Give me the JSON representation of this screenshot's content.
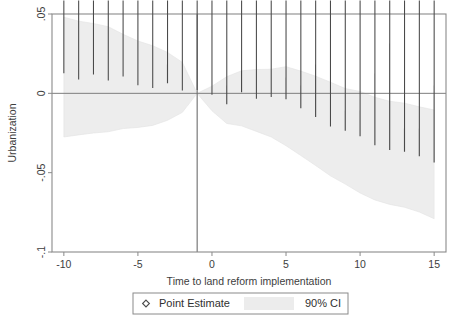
{
  "chart_data": {
    "type": "scatter",
    "title": "",
    "subtitle": "",
    "xlabel": "Time to land reform implementation",
    "ylabel": "Urbanization",
    "xlim": [
      -10.8,
      15.8
    ],
    "ylim": [
      -0.1,
      0.05
    ],
    "xticks": [
      -10,
      -5,
      0,
      5,
      10,
      15
    ],
    "xticklabels": [
      "-10",
      "-5",
      "0",
      "5",
      "10",
      "15"
    ],
    "yticks": [
      0.05,
      0,
      -0.05,
      -0.1
    ],
    "yticklabels": [
      ".05",
      "0",
      "-.05",
      "-.1"
    ],
    "grid": false,
    "legend_position": "below-plot",
    "reference_line_x": -1,
    "zero_line_y": 0,
    "x": [
      -10,
      -9,
      -8,
      -7,
      -6,
      -5,
      -4,
      -3,
      -2,
      -1,
      0,
      1,
      2,
      3,
      4,
      5,
      6,
      7,
      8,
      9,
      10,
      11,
      12,
      13,
      14,
      15
    ],
    "series": [
      {
        "name": "Point Estimate",
        "marker": "diamond-open",
        "values": [
          0.0105,
          0.0065,
          0.0098,
          0.006,
          0.0085,
          0.003,
          0.0012,
          0.0042,
          -0.0003,
          0.0,
          -0.003,
          -0.009,
          -0.0015,
          -0.0055,
          -0.0045,
          -0.0058,
          -0.0115,
          -0.017,
          -0.023,
          -0.0258,
          -0.0292,
          -0.0348,
          -0.0378,
          -0.039,
          -0.0418,
          -0.0458
        ]
      },
      {
        "name": "90% CI",
        "type": "band",
        "upper": [
          0.048,
          0.0455,
          0.044,
          0.042,
          0.0372,
          0.033,
          0.03,
          0.0258,
          0.0195,
          0.0,
          0.0045,
          0.0105,
          0.0142,
          0.015,
          0.0152,
          0.0168,
          0.014,
          0.0108,
          0.007,
          0.003,
          0.0012,
          -0.0025,
          -0.005,
          -0.0062,
          -0.0085,
          -0.0105
        ],
        "lower": [
          -0.0275,
          -0.0262,
          -0.025,
          -0.0242,
          -0.0222,
          -0.0215,
          -0.0202,
          -0.017,
          -0.012,
          0.0,
          -0.011,
          -0.019,
          -0.0205,
          -0.024,
          -0.0275,
          -0.033,
          -0.0392,
          -0.0455,
          -0.052,
          -0.0572,
          -0.0628,
          -0.0672,
          -0.07,
          -0.0718,
          -0.0748,
          -0.079
        ]
      }
    ],
    "legend": [
      {
        "label": "Point Estimate",
        "glyph": "diamond-open"
      },
      {
        "label": "90% CI",
        "glyph": "shaded-band"
      }
    ],
    "colors": {
      "band": "#ececec",
      "marker_stroke": "#4a4a4a",
      "axis": "#8a8a8a",
      "text": "#3d3d3d",
      "background": "#ffffff"
    }
  }
}
